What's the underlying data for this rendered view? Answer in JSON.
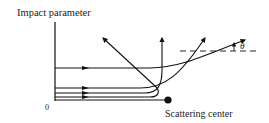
{
  "diagram": {
    "labels": {
      "y_axis": "Impact parameter",
      "origin": "0",
      "center": "Scattering center",
      "angle": "θ"
    },
    "colors": {
      "ink": "#111111",
      "background": "#ffffff"
    },
    "trajectories": [
      {
        "name": "largest-impact",
        "incoming_y": 68,
        "outgoing": "small-angle deflection to upper right"
      },
      {
        "name": "medium-impact",
        "incoming_y": 88,
        "outgoing": "moderate deflection up-right"
      },
      {
        "name": "small-impact",
        "incoming_y": 93,
        "outgoing": "90 degree deflection upward"
      },
      {
        "name": "smallest-impact",
        "incoming_y": 97,
        "outgoing": "backscatter to upper left"
      },
      {
        "name": "head-on",
        "incoming_y": 100,
        "outgoing": "hits scattering center"
      }
    ]
  }
}
